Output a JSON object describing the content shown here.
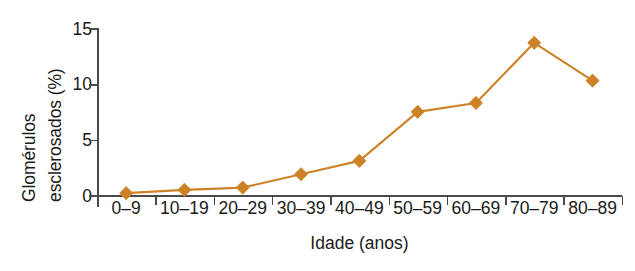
{
  "chart_data": {
    "type": "line",
    "title": "",
    "subtitle": "",
    "xlabel": "Idade (anos)",
    "ylabel": "Glomérulos esclerosados (%)",
    "ylabel_line1": "Glomérulos",
    "ylabel_line2": "esclerosados (%)",
    "categories": [
      "0–9",
      "10–19",
      "20–29",
      "30–39",
      "40–49",
      "50–59",
      "60–69",
      "70–79",
      "80–89"
    ],
    "values": [
      0.2,
      0.5,
      0.7,
      1.9,
      3.1,
      7.5,
      8.3,
      13.7,
      10.3
    ],
    "series": [
      {
        "name": "Glomérulos esclerosados (%)",
        "values": [
          0.2,
          0.5,
          0.7,
          1.9,
          3.1,
          7.5,
          8.3,
          13.7,
          10.3
        ]
      }
    ],
    "yticks": [
      0,
      5,
      10,
      15
    ],
    "ytick_labels": [
      "0",
      "5",
      "10",
      "15"
    ],
    "ylim": [
      0,
      15
    ],
    "xlim_categories": 9,
    "grid": false,
    "legend": false,
    "legend_position": "none",
    "marker": "diamond",
    "series_color": "#CE8227",
    "axis_color": "#4A4A4A",
    "text_color": "#1A1A1A",
    "background": "#FFFFFF",
    "annotations": []
  }
}
